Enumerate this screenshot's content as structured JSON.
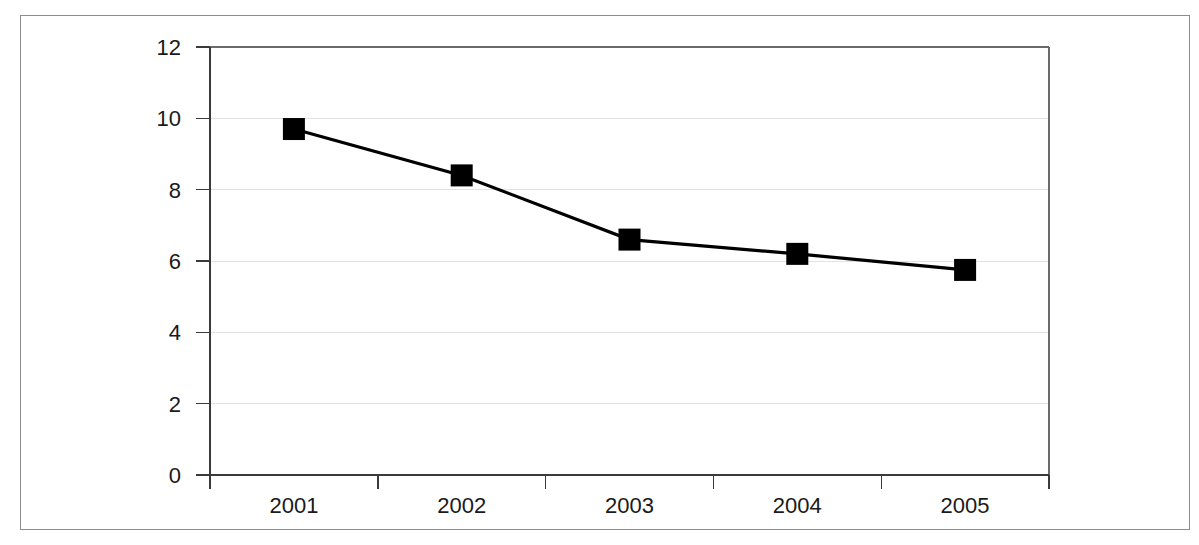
{
  "chart_data": {
    "type": "line",
    "title": "",
    "subtitle": "",
    "xlabel": "",
    "ylabel": "",
    "categories": [
      "2001",
      "2002",
      "2003",
      "2004",
      "2005"
    ],
    "values": [
      9.7,
      8.4,
      6.6,
      6.2,
      5.75
    ],
    "series": [
      {
        "name": "series-1",
        "values": [
          9.7,
          8.4,
          6.6,
          6.2,
          5.75
        ],
        "color": "#000000",
        "marker": "square",
        "line_style": "solid"
      }
    ],
    "ylim": [
      0,
      12
    ],
    "yticks": [
      0,
      2,
      4,
      6,
      8,
      10,
      12
    ],
    "ytick_labels": [
      "0",
      "2",
      "4",
      "6",
      "8",
      "10",
      "12"
    ],
    "xtick_labels": [
      "2001",
      "2002",
      "2003",
      "2004",
      "2005"
    ],
    "grid": {
      "horizontal": true,
      "vertical": false,
      "color": "#e2e2e2"
    },
    "legend": {
      "visible": false,
      "position": "none",
      "entries": []
    },
    "annotations": [],
    "frame": {
      "outer_border": true,
      "outer_border_color": "#8d8d8d",
      "plot_border_color": "#6a6a6a",
      "axis_color": "#3a3a3a",
      "background": "#ffffff"
    }
  }
}
